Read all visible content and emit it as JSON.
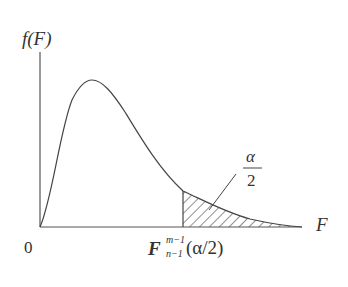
{
  "diagram": {
    "y_axis_label": "f(F)",
    "x_axis_label": "F",
    "origin_label": "0",
    "critical_value": {
      "base": "F",
      "superscript": "m−1",
      "subscript": "n−1",
      "argument": "(α/2)"
    },
    "tail_area": {
      "numerator": "α",
      "denominator": "2"
    },
    "colors": {
      "line": "#444444",
      "hatch": "#444444",
      "background": "#ffffff"
    }
  }
}
